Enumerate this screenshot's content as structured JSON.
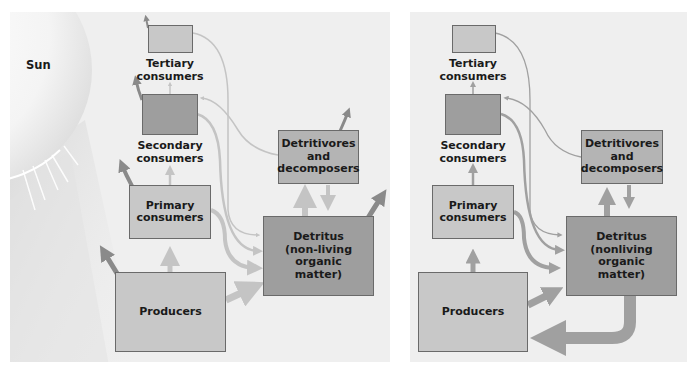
{
  "panels": [
    {
      "id": "left",
      "sun_label": "Sun",
      "nodes": {
        "tertiary": "Tertiary consumers",
        "secondary": "Secondary consumers",
        "primary": "Primary consumers",
        "producers": "Producers",
        "detritivores": "Detritivores and decomposers",
        "detritus": "Detritus (non-living organic matter)"
      }
    },
    {
      "id": "right",
      "nodes": {
        "tertiary": "Tertiary consumers",
        "secondary": "Secondary consumers",
        "primary": "Primary consumers",
        "producers": "Producers",
        "detritivores": "Detritivores and decomposers",
        "detritus": "Detritus (nonliving organic matter)"
      }
    }
  ],
  "labels": {
    "left": {
      "sun": "Sun",
      "tertiary_1": "Tertiary",
      "tertiary_2": "consumers",
      "secondary_1": "Secondary",
      "secondary_2": "consumers",
      "primary_1": "Primary",
      "primary_2": "consumers",
      "producers": "Producers",
      "detritivores_1": "Detritivores",
      "detritivores_2": "and",
      "detritivores_3": "decomposers",
      "detritus_1": "Detritus",
      "detritus_2": "(non-living organic",
      "detritus_3": "matter)"
    },
    "right": {
      "tertiary_1": "Tertiary",
      "tertiary_2": "consumers",
      "secondary_1": "Secondary",
      "secondary_2": "consumers",
      "primary_1": "Primary",
      "primary_2": "consumers",
      "producers": "Producers",
      "detritivores_1": "Detritivores",
      "detritivores_2": "and",
      "detritivores_3": "decomposers",
      "detritus_1": "Detritus",
      "detritus_2": "(nonliving organic",
      "detritus_3": "matter)"
    }
  },
  "colors": {
    "panel_bg": "#efefef",
    "box_light": "#c8c8c8",
    "box_dark": "#9e9e9e",
    "energy_arrow": "#c4c4c4",
    "heat_arrow": "#8a8a8a",
    "cycle_arrow": "#a0a0a0"
  },
  "flows": {
    "left": [
      {
        "from": "Producers",
        "to": "Primary consumers",
        "kind": "energy"
      },
      {
        "from": "Primary consumers",
        "to": "Secondary consumers",
        "kind": "energy"
      },
      {
        "from": "Secondary consumers",
        "to": "Tertiary consumers",
        "kind": "energy"
      },
      {
        "from": "Producers",
        "to": "Detritus",
        "kind": "energy"
      },
      {
        "from": "Primary consumers",
        "to": "Detritus",
        "kind": "energy"
      },
      {
        "from": "Secondary consumers",
        "to": "Detritus",
        "kind": "energy"
      },
      {
        "from": "Tertiary consumers",
        "to": "Detritus",
        "kind": "energy"
      },
      {
        "from": "Detritus",
        "to": "Detritivores and decomposers",
        "kind": "energy"
      },
      {
        "from": "Detritivores and decomposers",
        "to": "Detritus",
        "kind": "energy"
      },
      {
        "from": "Detritivores and decomposers",
        "to": "Secondary consumers",
        "kind": "energy"
      },
      {
        "from": "Each level",
        "to": "Heat loss",
        "kind": "heat"
      }
    ],
    "right": [
      {
        "from": "Producers",
        "to": "Primary consumers",
        "kind": "nutrient"
      },
      {
        "from": "Primary consumers",
        "to": "Secondary consumers",
        "kind": "nutrient"
      },
      {
        "from": "Secondary consumers",
        "to": "Tertiary consumers",
        "kind": "nutrient"
      },
      {
        "from": "Producers",
        "to": "Detritus",
        "kind": "nutrient"
      },
      {
        "from": "Primary consumers",
        "to": "Detritus",
        "kind": "nutrient"
      },
      {
        "from": "Secondary consumers",
        "to": "Detritus",
        "kind": "nutrient"
      },
      {
        "from": "Tertiary consumers",
        "to": "Detritus",
        "kind": "nutrient"
      },
      {
        "from": "Detritus",
        "to": "Detritivores and decomposers",
        "kind": "nutrient"
      },
      {
        "from": "Detritivores and decomposers",
        "to": "Detritus",
        "kind": "nutrient"
      },
      {
        "from": "Detritivores and decomposers",
        "to": "Secondary consumers",
        "kind": "nutrient"
      },
      {
        "from": "Detritus",
        "to": "Producers",
        "kind": "nutrient-recycle"
      }
    ]
  }
}
